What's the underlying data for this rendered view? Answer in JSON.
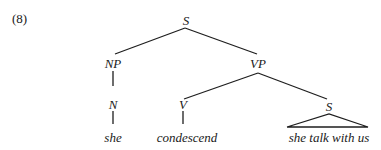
{
  "example_number": "(8)",
  "tree": {
    "root": {
      "label": "S",
      "children": [
        {
          "label": "NP",
          "children": [
            {
              "label": "N",
              "children": [
                {
                  "label": "she"
                }
              ]
            }
          ]
        },
        {
          "label": "VP",
          "children": [
            {
              "label": "V",
              "children": [
                {
                  "label": "condescend"
                }
              ]
            },
            {
              "label": "S",
              "triangle": true,
              "children": [
                {
                  "label": "she talk with us"
                }
              ]
            }
          ]
        }
      ]
    }
  },
  "nodes": {
    "s_root": "S",
    "np": "NP",
    "n": "N",
    "she": "she",
    "vp": "VP",
    "v": "V",
    "condescend": "condescend",
    "s_embedded": "S",
    "embedded_clause": "she talk with us"
  },
  "colors": {
    "ink": "#1e1e1e",
    "background": "#ffffff"
  }
}
